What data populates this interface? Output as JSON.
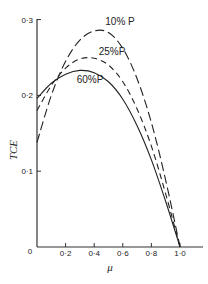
{
  "chart_data": {
    "type": "line",
    "title": "",
    "xlabel": "μ",
    "ylabel": "TCE",
    "xlim": [
      0,
      1.15
    ],
    "ylim": [
      0,
      0.3
    ],
    "grid": false,
    "legend_position": "inline labels near curve peaks",
    "x_ticks": [
      {
        "value": 0,
        "label": "0"
      },
      {
        "value": 0.2,
        "label": "0·2"
      },
      {
        "value": 0.4,
        "label": "0·4"
      },
      {
        "value": 0.6,
        "label": "0·6"
      },
      {
        "value": 0.8,
        "label": "0·8"
      },
      {
        "value": 1.0,
        "label": "1·0"
      }
    ],
    "y_ticks": [
      {
        "value": 0.1,
        "label": "0·1"
      },
      {
        "value": 0.2,
        "label": "0·2"
      },
      {
        "value": 0.3,
        "label": "0·3"
      }
    ],
    "x": [
      0,
      0.1,
      0.2,
      0.3,
      0.4,
      0.5,
      0.6,
      0.7,
      0.8,
      0.9,
      1.0
    ],
    "series": [
      {
        "name": "10% P",
        "style": "long-dash",
        "values": [
          0.138,
          0.2,
          0.245,
          0.273,
          0.285,
          0.283,
          0.262,
          0.222,
          0.164,
          0.088,
          0.0
        ]
      },
      {
        "name": "25% P",
        "style": "dash",
        "values": [
          0.18,
          0.213,
          0.236,
          0.248,
          0.249,
          0.24,
          0.218,
          0.182,
          0.133,
          0.07,
          0.0
        ]
      },
      {
        "name": "60%P",
        "style": "solid",
        "values": [
          0.196,
          0.216,
          0.228,
          0.233,
          0.23,
          0.218,
          0.195,
          0.16,
          0.115,
          0.06,
          0.0
        ]
      }
    ]
  },
  "labels": {
    "y_axis": "TCE",
    "x_axis": "μ",
    "origin": "0",
    "series_10": "10% P",
    "series_25": "25%P",
    "series_60": "60%P"
  }
}
